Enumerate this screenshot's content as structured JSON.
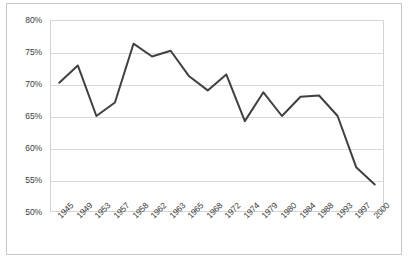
{
  "figure": {
    "caption": ""
  },
  "chart_data": {
    "type": "line",
    "title": "",
    "subtitle": "",
    "xlabel": "",
    "ylabel": "",
    "categories": [
      "1945",
      "1949",
      "1953",
      "1957",
      "1958",
      "1962",
      "1963",
      "1965",
      "1968",
      "1972",
      "1974",
      "1979",
      "1980",
      "1984",
      "1988",
      "1993",
      "1997",
      "2000"
    ],
    "values": [
      70.2,
      72.9,
      65.0,
      67.1,
      76.3,
      74.3,
      75.2,
      71.2,
      69.0,
      71.5,
      64.2,
      68.7,
      65.0,
      68.0,
      68.2,
      65.0,
      57.0,
      54.3
    ],
    "series": [
      {
        "name": "",
        "values": [
          70.2,
          72.9,
          65.0,
          67.1,
          76.3,
          74.3,
          75.2,
          71.2,
          69.0,
          71.5,
          64.2,
          68.7,
          65.0,
          68.0,
          68.2,
          65.0,
          57.0,
          54.3
        ]
      }
    ],
    "ylim": [
      50,
      80
    ],
    "yticks": [
      50,
      55,
      60,
      65,
      70,
      75,
      80
    ],
    "ytick_labels": [
      "50%",
      "55%",
      "60%",
      "65%",
      "70%",
      "75%",
      "80%"
    ],
    "grid": "horizontal",
    "legend": "none",
    "line_color": "#404040",
    "gridline_color": "#d9d9d9",
    "frame_color": "#c8c8c8",
    "markers": "none"
  }
}
